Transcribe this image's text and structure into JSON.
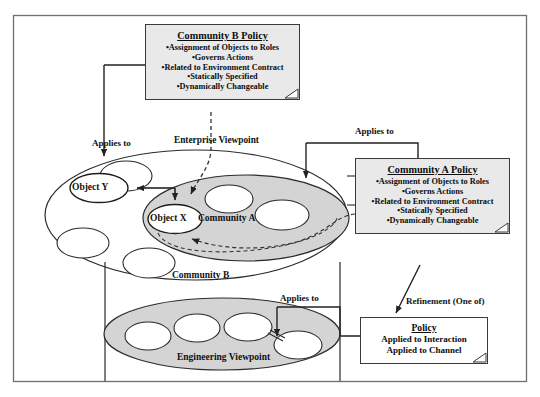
{
  "diagram": {
    "frame": {
      "name": "outer-frame"
    },
    "colors": {
      "note_fill": "#e9e9e9",
      "shaded_ellipse_fill": "#d4d4d4",
      "white_fill": "#ffffff",
      "line": "#2b2b2b"
    }
  },
  "notes": {
    "community_b_policy": {
      "title": "Community B Policy",
      "bullets": [
        "•Assignment of Objects to Roles",
        "•Governs Actions",
        "•Related to Environment Contract",
        "•Statically Specified",
        "•Dynamically Changeable"
      ]
    },
    "community_a_policy": {
      "title": "Community A Policy",
      "bullets": [
        "•Assignment of Objects to Roles",
        "•Governs Actions",
        "•Related to Environment Contract",
        "•Statically Specified",
        "•Dynamically Changeable"
      ]
    },
    "policy_refinement": {
      "title": "Policy",
      "bullets": [
        "Applied to Interaction",
        "Applied to Channel"
      ]
    }
  },
  "labels": {
    "enterprise_viewpoint": "Enterprise Viewpoint",
    "engineering_viewpoint": "Engineering Viewpoint",
    "community_a": "Community A",
    "community_b": "Community B",
    "object_x": "Object X",
    "object_y": "Object Y",
    "applies_to_left": "Applies to",
    "applies_to_right": "Applies to",
    "applies_to_engineering": "Applies to",
    "refinement": "Refinement (One of)"
  }
}
